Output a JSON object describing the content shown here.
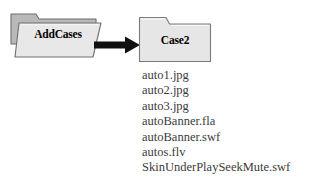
{
  "diagram": {
    "source_folder": {
      "name": "AddCases",
      "icon": "folder-3d-icon",
      "back_color": "#b9b9b9",
      "front_color": "#e8e8e8",
      "outline_color": "#6e6e6e"
    },
    "arrow": {
      "icon": "arrow-right-icon",
      "color": "#101010"
    },
    "target_folder": {
      "name": "Case2",
      "icon": "folder-icon",
      "fill_color": "#e6e6e6",
      "outline_color": "#7a7a7a"
    },
    "files": [
      {
        "name": "auto1.jpg"
      },
      {
        "name": "auto2.jpg"
      },
      {
        "name": "auto3.jpg"
      },
      {
        "name": "autoBanner.fla"
      },
      {
        "name": "autoBanner.swf"
      },
      {
        "name": "autos.flv"
      },
      {
        "name": "SkinUnderPlaySeekMute.swf"
      }
    ]
  }
}
